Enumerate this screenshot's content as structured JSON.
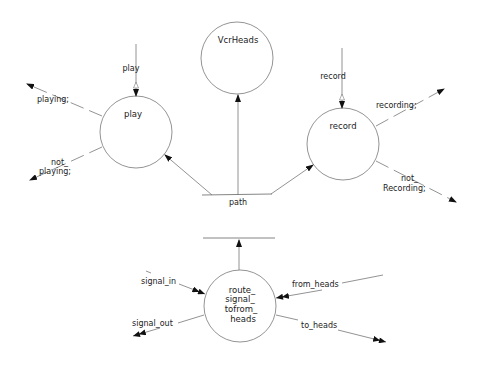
{
  "diagram": {
    "type": "data-flow-diagram",
    "processes": [
      {
        "id": "play",
        "label": "play"
      },
      {
        "id": "vcrheads",
        "label": "VcrHeads"
      },
      {
        "id": "record",
        "label": "record"
      },
      {
        "id": "route",
        "label_lines": [
          "route_",
          "signal_",
          "tofrom_",
          "heads"
        ]
      }
    ],
    "stores": [
      {
        "id": "path",
        "label": "path"
      }
    ],
    "flows": {
      "play_in": "play",
      "playing": "playing;",
      "not_playing_1": "not_",
      "not_playing_2": "playing;",
      "record_in": "record",
      "recording": "recording;",
      "not_recording_1": "not_",
      "not_recording_2": "Recording;",
      "signal_in": "signal_in",
      "signal_out": "signal_out",
      "from_heads": "from_heads",
      "to_heads": "to_heads"
    }
  }
}
